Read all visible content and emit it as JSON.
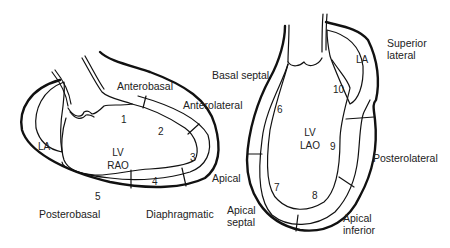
{
  "rao": {
    "chamber": "LV",
    "view": "RAO",
    "atrium": "LA",
    "labels": {
      "anterobasal": "Anterobasal",
      "anterolateral": "Anterolateral",
      "apical": "Apical",
      "diaphragmatic": "Diaphragmatic",
      "posterobasal": "Posterobasal"
    },
    "segments": [
      "1",
      "2",
      "3",
      "4",
      "5"
    ]
  },
  "lao": {
    "chamber": "LV",
    "view": "LAO",
    "atrium": "LA",
    "labels": {
      "basal_septal": "Basal septal",
      "superior_lateral_1": "Superior",
      "superior_lateral_2": "lateral",
      "posterolateral": "Posterolateral",
      "apical_septal_1": "Apical",
      "apical_septal_2": "septal",
      "apical_inferior_1": "Apical",
      "apical_inferior_2": "inferior"
    },
    "segments": [
      "6",
      "7",
      "8",
      "9",
      "10"
    ]
  }
}
